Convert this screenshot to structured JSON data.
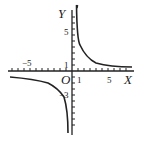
{
  "figure": {
    "type": "function-graph",
    "function": "y = k/x (hyperbola, k>0)",
    "axes": {
      "x_label": "X",
      "y_label": "Y",
      "origin_label": "O"
    },
    "tick_labels": {
      "x_neg": "−5",
      "x_one": "1",
      "x_five": "5",
      "y_one": "1",
      "y_five": "5",
      "y_neg": "−3"
    },
    "colors": {
      "stroke": "#222222",
      "background": "#ffffff"
    }
  }
}
